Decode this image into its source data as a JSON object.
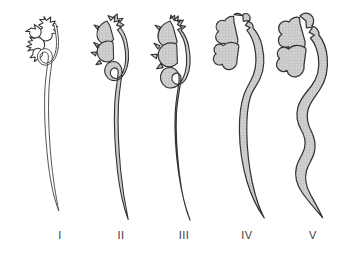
{
  "figure": {
    "background_color": "#ffffff",
    "outline_color": "#2e2e2e",
    "fill_color": "#c9c9c9",
    "unfilled_color": "#ffffff",
    "width": 340,
    "height": 258
  },
  "labels": [
    {
      "text": "I",
      "x": 60,
      "grade": 1
    },
    {
      "text": "II",
      "x": 121,
      "grade": 2
    },
    {
      "text": "III",
      "x": 184,
      "grade": 3
    },
    {
      "text": "IV",
      "x": 247,
      "grade": 4
    },
    {
      "text": "V",
      "x": 313,
      "grade": 5
    }
  ],
  "panels": [
    {
      "id": "panel-i",
      "label": "I",
      "filled": false,
      "calyx_style": "sharp-spiky",
      "ureter_width": 2.4,
      "description": "Normal: slender non-dilated collecting system with sharp cupped calyces and thin ureter"
    },
    {
      "id": "panel-ii",
      "label": "II",
      "filled": true,
      "calyx_style": "sharp-spiky",
      "ureter_width": 4.5,
      "description": "Mild dilatation of renal pelvis with preserved sharp calyces"
    },
    {
      "id": "panel-iii",
      "label": "III",
      "filled": true,
      "calyx_style": "sharp-spiky",
      "ureter_width": 7.5,
      "description": "Moderate dilatation of pelvis and calyces with dilated ureter"
    },
    {
      "id": "panel-iv",
      "label": "IV",
      "filled": true,
      "calyx_style": "blunted",
      "ureter_width": 11,
      "description": "Marked dilatation with blunting of calyces and widened tortuous ureter"
    },
    {
      "id": "panel-v",
      "label": "V",
      "filled": true,
      "calyx_style": "ballooned",
      "ureter_width": 15,
      "description": "Severe dilatation with ballooned calyces and grossly tortuous dilated ureter"
    }
  ]
}
